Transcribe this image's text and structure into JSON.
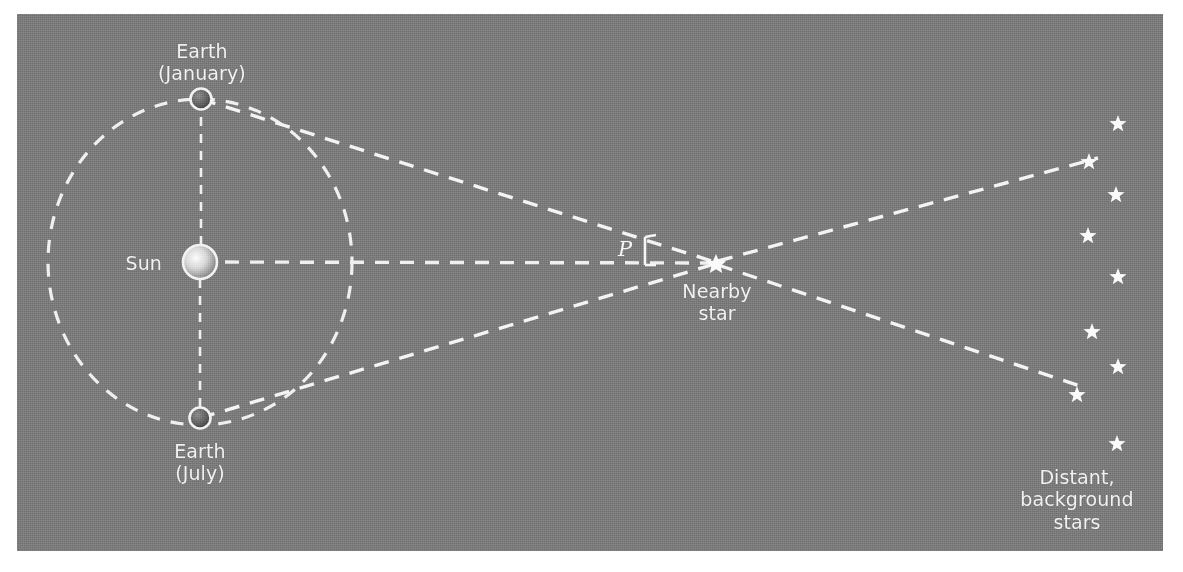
{
  "figure": {
    "panel": {
      "background_color": "#7b7b7b",
      "line_color": "#f2f2f2",
      "page_color": "#ffffff"
    },
    "labels": {
      "earth_january": "Earth\n(January)",
      "earth_july": "Earth\n(July)",
      "sun": "Sun",
      "nearby_star": "Nearby\nstar",
      "distant_stars": "Distant,\nbackground\nstars",
      "parallax_angle": "P"
    },
    "objects": {
      "sun": {
        "name": "Sun",
        "cx": 200,
        "cy": 262,
        "r": 17
      },
      "earth_january": {
        "name": "Earth (January)",
        "cx": 201,
        "cy": 99,
        "r": 11
      },
      "earth_july": {
        "name": "Earth (July)",
        "cx": 200,
        "cy": 418,
        "r": 11
      },
      "nearby_star": {
        "name": "Nearby star",
        "cx": 716,
        "cy": 263,
        "r": 9
      },
      "orbit": {
        "name": "Earth orbit",
        "cx": 200,
        "cy": 262,
        "rx": 152,
        "ry": 163
      }
    },
    "background_stars": [
      {
        "x": 1118,
        "y": 124
      },
      {
        "x": 1089,
        "y": 162
      },
      {
        "x": 1116,
        "y": 195
      },
      {
        "x": 1088,
        "y": 236
      },
      {
        "x": 1118,
        "y": 277
      },
      {
        "x": 1092,
        "y": 332
      },
      {
        "x": 1118,
        "y": 367
      },
      {
        "x": 1077,
        "y": 395
      },
      {
        "x": 1117,
        "y": 444
      }
    ],
    "sightlines": [
      {
        "name": "january-to-star",
        "from": [
          201,
          99
        ],
        "to": [
          716,
          263
        ]
      },
      {
        "name": "july-to-star",
        "from": [
          200,
          418
        ],
        "to": [
          716,
          263
        ]
      },
      {
        "name": "star-to-upper-bg",
        "from": [
          716,
          263
        ],
        "to": [
          1098,
          158
        ]
      },
      {
        "name": "star-to-lower-bg",
        "from": [
          716,
          263
        ],
        "to": [
          1086,
          388
        ]
      },
      {
        "name": "sun-to-star-baseline",
        "from": [
          200,
          262
        ],
        "to": [
          716,
          263
        ]
      },
      {
        "name": "sun-to-january-radius",
        "from": [
          200,
          262
        ],
        "to": [
          201,
          99
        ]
      },
      {
        "name": "sun-to-july-radius",
        "from": [
          200,
          262
        ],
        "to": [
          200,
          418
        ]
      }
    ],
    "angle_marker": {
      "name": "parallax-angle-bracket",
      "x": 645,
      "y_top": 237,
      "y_bottom": 265,
      "tick_length": 11
    }
  }
}
